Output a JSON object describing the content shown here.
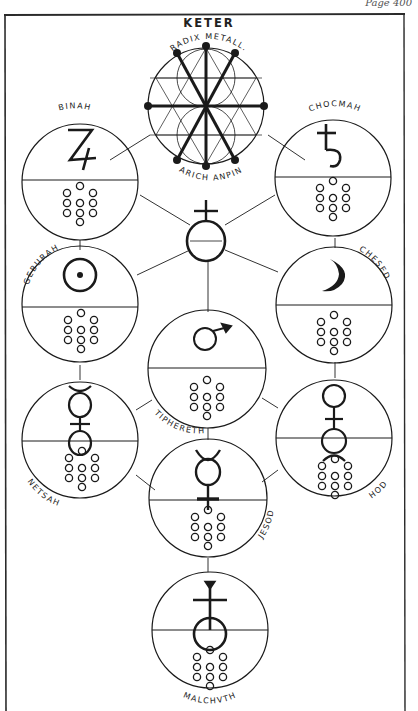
{
  "page": {
    "number_label": "Page 400"
  },
  "diagram": {
    "title": "KETER",
    "keter": {
      "top_inscription": "RADIX METALL.",
      "bottom_inscription": "ARICH ANPIN"
    },
    "sefirot": [
      {
        "id": "keter",
        "name": "KETER",
        "symbol": "hexagram-wheel",
        "dots": 0
      },
      {
        "id": "binah",
        "name": "BINAH",
        "symbol": "jupiter",
        "dots": 10
      },
      {
        "id": "chocmah",
        "name": "CHOCMAH",
        "symbol": "saturn",
        "dots": 10
      },
      {
        "id": "geburah",
        "name": "GEBURAH",
        "symbol": "sun",
        "dots": 10
      },
      {
        "id": "chesed",
        "name": "CHESED",
        "symbol": "moon",
        "dots": 10
      },
      {
        "id": "tiphereth",
        "name": "TIPHERETH",
        "symbol": "mars",
        "dots": 10
      },
      {
        "id": "netsah",
        "name": "NETSAH",
        "symbol": "venus-with-horns",
        "dots": 10
      },
      {
        "id": "hod",
        "name": "HOD",
        "symbol": "venus-inverted-horns",
        "dots": 10
      },
      {
        "id": "jesod",
        "name": "JESOD",
        "symbol": "mercury",
        "dots": 10
      },
      {
        "id": "malchuth",
        "name": "MALCHVTH",
        "symbol": "antimony-orb",
        "dots": 10
      }
    ],
    "hub_symbol": "orb-with-cross",
    "colors": {
      "ink": "#1a1a1a",
      "paper": "#ffffff"
    }
  }
}
